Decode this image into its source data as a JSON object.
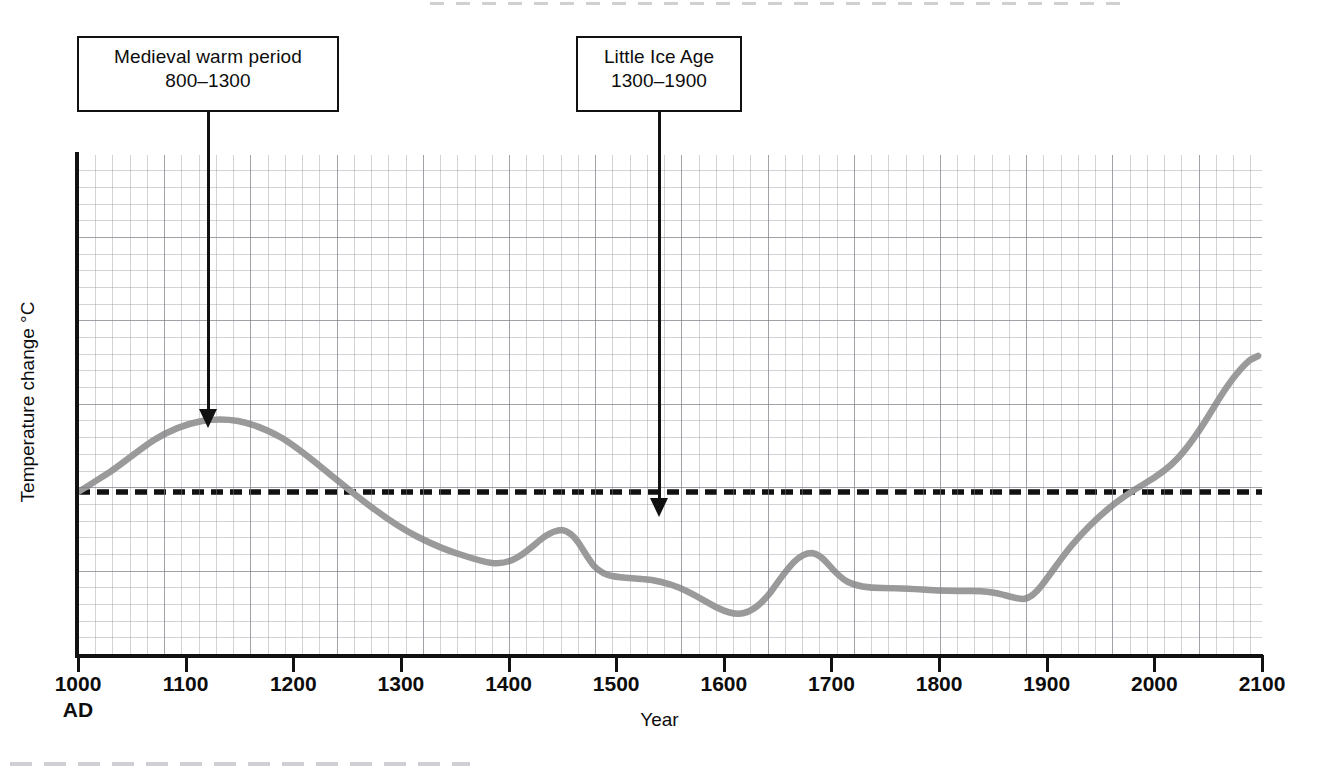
{
  "chart_data": {
    "type": "line",
    "title": "",
    "xlabel": "Year",
    "ylabel": "Temperature change °C",
    "xlim": [
      1000,
      2100
    ],
    "xticks": [
      1000,
      1100,
      1200,
      1300,
      1400,
      1500,
      1600,
      1700,
      1800,
      1900,
      2000,
      2100
    ],
    "xtick_labels": [
      "1000",
      "1100",
      "1200",
      "1300",
      "1400",
      "1500",
      "1600",
      "1700",
      "1800",
      "1900",
      "2000",
      "2100"
    ],
    "xtick_sublabel": "AD",
    "yticks": [],
    "ytick_labels": [],
    "grid": true,
    "legend": false,
    "reference_line": {
      "label": "baseline",
      "style": "dashed",
      "color": "#111111",
      "value": 0.0
    },
    "series": [
      {
        "name": "Temperature change",
        "color": "#9a9a9a",
        "x": [
          1000,
          1030,
          1060,
          1090,
          1115,
          1140,
          1170,
          1200,
          1230,
          1260,
          1290,
          1310,
          1340,
          1370,
          1400,
          1430,
          1450,
          1470,
          1490,
          1500,
          1515,
          1535,
          1555,
          1575,
          1600,
          1620,
          1640,
          1655,
          1670,
          1685,
          1700,
          1710,
          1725,
          1745,
          1770,
          1800,
          1830,
          1860,
          1880,
          1900,
          1920,
          1930,
          1950,
          1970,
          1990,
          2010,
          2030,
          2050,
          2075,
          2100
        ],
        "y": [
          0.0,
          0.14,
          0.3,
          0.42,
          0.48,
          0.5,
          0.48,
          0.43,
          0.33,
          0.2,
          0.07,
          0.0,
          -0.12,
          -0.22,
          -0.3,
          -0.37,
          -0.41,
          -0.4,
          -0.3,
          -0.22,
          -0.27,
          -0.33,
          -0.34,
          -0.35,
          -0.38,
          -0.46,
          -0.53,
          -0.55,
          -0.48,
          -0.3,
          -0.16,
          -0.14,
          -0.17,
          -0.23,
          -0.26,
          -0.26,
          -0.27,
          -0.26,
          -0.29,
          -0.21,
          -0.07,
          0.0,
          0.12,
          0.2,
          0.27,
          0.42,
          0.6,
          0.78,
          0.93,
          1.04
        ]
      }
    ],
    "annotations": [
      {
        "id": "medieval-warm-period",
        "lines": [
          "Medieval warm period",
          "800–1300"
        ],
        "points_to_year": 1135,
        "points_to_value": 0.5
      },
      {
        "id": "little-ice-age",
        "lines": [
          "Little Ice Age",
          "1300–1900"
        ],
        "points_to_year": 1540,
        "points_to_value": -0.28
      }
    ]
  },
  "annotations": {
    "medieval": {
      "line1": "Medieval warm period",
      "line2": "800–1300"
    },
    "little_ice_age": {
      "line1": "Little Ice Age",
      "line2": "1300–1900"
    }
  },
  "axes": {
    "x_title": "Year",
    "y_title": "Temperature change °C",
    "x_start_sublabel": "AD",
    "x_labels": [
      "1000",
      "1100",
      "1200",
      "1300",
      "1400",
      "1500",
      "1600",
      "1700",
      "1800",
      "1900",
      "2000",
      "2100"
    ]
  },
  "colors": {
    "curve": "#9a9a9a",
    "axis": "#111111",
    "baseline": "#111111",
    "grid_major": "#787880",
    "grid_minor": "#9696a0",
    "background": "#ffffff"
  }
}
